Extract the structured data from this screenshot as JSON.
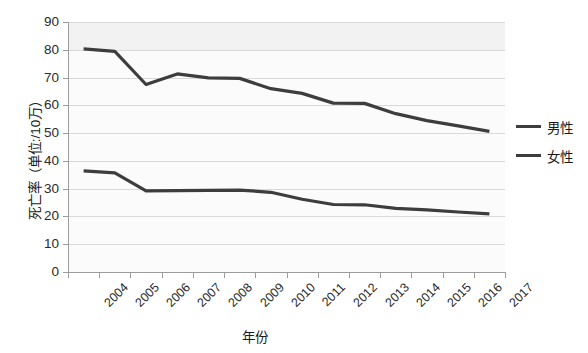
{
  "chart_data": {
    "type": "line",
    "title": "",
    "xlabel": "年份",
    "ylabel": "死亡率（单位:/10万）",
    "ylim": [
      0,
      90
    ],
    "ytick_labels": [
      "90",
      "80",
      "70",
      "60",
      "50",
      "40",
      "30",
      "20",
      "10",
      "0"
    ],
    "ytick_values": [
      90,
      80,
      70,
      60,
      50,
      40,
      30,
      20,
      10,
      0
    ],
    "grid": true,
    "legend_position": "right",
    "categories": [
      "2004",
      "2005",
      "2006",
      "2007",
      "2008",
      "2009",
      "2010",
      "2011",
      "2012",
      "2013",
      "2014",
      "2015",
      "2016",
      "2017"
    ],
    "series": [
      {
        "name": "男性",
        "color": "#3d3d3d",
        "values": [
          80.3,
          79.4,
          67.5,
          71.3,
          69.9,
          69.7,
          66.0,
          64.3,
          60.8,
          60.7,
          57.0,
          54.5,
          52.6,
          50.6
        ]
      },
      {
        "name": "女性",
        "color": "#3d3d3d",
        "values": [
          36.4,
          35.7,
          29.2,
          29.3,
          29.4,
          29.5,
          28.7,
          26.2,
          24.3,
          24.2,
          22.9,
          22.4,
          21.6,
          20.9
        ]
      }
    ]
  },
  "legend": {
    "items": [
      {
        "label": "男性"
      },
      {
        "label": "女性"
      }
    ]
  },
  "axes": {
    "y_title": "死亡率（单位:/10万）",
    "x_title": "年份"
  }
}
